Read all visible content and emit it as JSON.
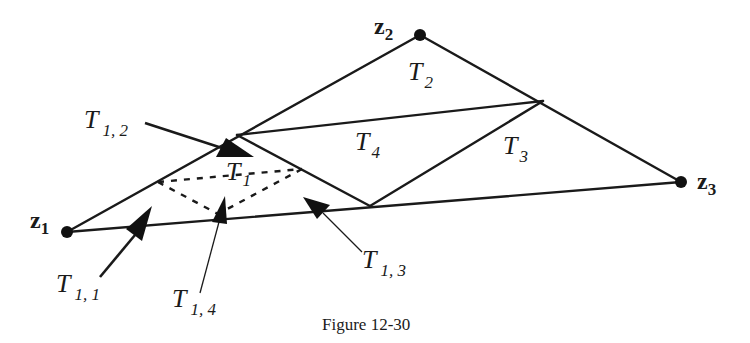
{
  "figure": {
    "caption": "Figure 12-30",
    "colors": {
      "ink": "#1a1a1a",
      "background": "#ffffff"
    }
  },
  "vertices": [
    {
      "id": "z1",
      "letter": "z",
      "sub": "1",
      "x": 67,
      "y": 232
    },
    {
      "id": "z2",
      "letter": "z",
      "sub": "2",
      "x": 420,
      "y": 35
    },
    {
      "id": "z3",
      "letter": "z",
      "sub": "3",
      "x": 681,
      "y": 182
    }
  ],
  "midpoints": {
    "z1z2": {
      "x": 237,
      "y": 135
    },
    "z2z3": {
      "x": 543,
      "y": 101
    },
    "z1z3": {
      "x": 370,
      "y": 206
    }
  },
  "triangles": [
    {
      "id": "T2",
      "letter": "T",
      "sub": "2"
    },
    {
      "id": "T3",
      "letter": "T",
      "sub": "3"
    },
    {
      "id": "T4",
      "letter": "T",
      "sub": "4"
    },
    {
      "id": "T1",
      "letter": "T",
      "sub": "1"
    }
  ],
  "subtriangles": [
    {
      "id": "T1,1",
      "letter": "T",
      "sub": "1, 1"
    },
    {
      "id": "T1,2",
      "letter": "T",
      "sub": "1, 2"
    },
    {
      "id": "T1,3",
      "letter": "T",
      "sub": "1, 3"
    },
    {
      "id": "T1,4",
      "letter": "T",
      "sub": "1, 4"
    }
  ],
  "inner_dashed_triangle": [
    {
      "x": 158,
      "y": 182
    },
    {
      "x": 302,
      "y": 169
    },
    {
      "x": 218,
      "y": 214
    }
  ]
}
